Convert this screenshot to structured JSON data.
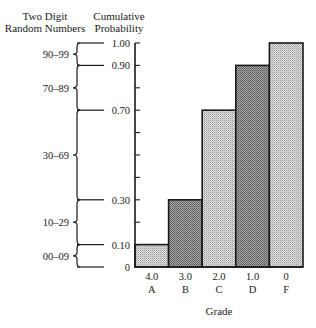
{
  "chart_data": {
    "type": "bar",
    "title": "",
    "xlabel": "Grade",
    "ylabel": "Cumulative Probability",
    "left_header": [
      "Two Digit",
      "Random Numbers"
    ],
    "categories": [
      "A",
      "B",
      "C",
      "D",
      "F"
    ],
    "category_values": [
      "4.0",
      "3.0",
      "2.0",
      "1.0",
      "0"
    ],
    "values": [
      0.1,
      0.3,
      0.7,
      0.9,
      1.0
    ],
    "ylim": [
      0,
      1.0
    ],
    "y_tick_labels": [
      "0",
      "0.10",
      "0.30",
      "0.70",
      "0.90",
      "1.00"
    ],
    "y_minor_ticks": [
      0.2,
      0.4,
      0.5,
      0.6,
      0.8
    ],
    "random_number_ranges": [
      {
        "label": "00–09",
        "from": 0.0,
        "to": 0.1
      },
      {
        "label": "10–29",
        "from": 0.1,
        "to": 0.3
      },
      {
        "label": "30–69",
        "from": 0.3,
        "to": 0.7
      },
      {
        "label": "70–89",
        "from": 0.7,
        "to": 0.9
      },
      {
        "label": "90–99",
        "from": 0.9,
        "to": 1.0
      }
    ],
    "fills": [
      "light",
      "dark",
      "light",
      "dark",
      "light"
    ],
    "grid": false,
    "legend": null
  },
  "colors": {
    "light_fill": "#cfcfcf",
    "dark_fill": "#8c8c8c",
    "ink": "#1a1a1a"
  }
}
